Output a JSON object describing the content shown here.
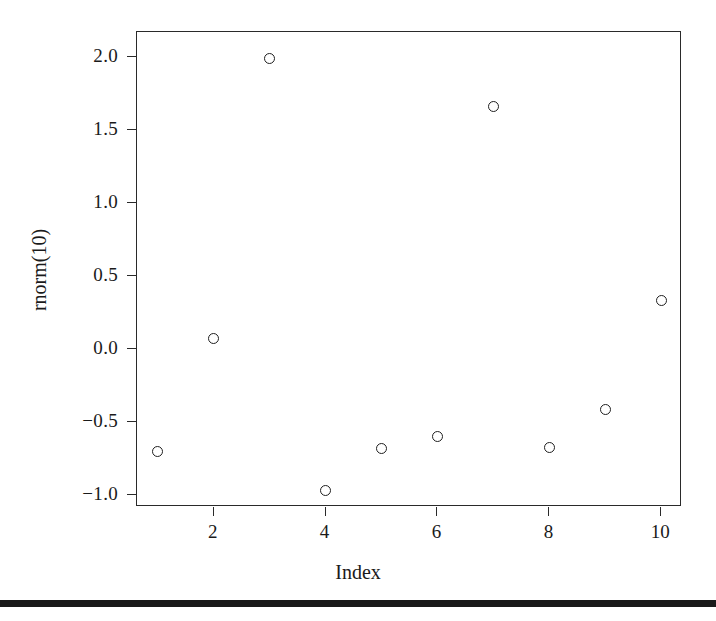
{
  "chart_data": {
    "type": "scatter",
    "title": "",
    "subtitle": "",
    "xlabel": "Index",
    "ylabel": "rnorm(10)",
    "x": [
      1,
      2,
      3,
      4,
      5,
      6,
      7,
      8,
      9,
      10
    ],
    "values": [
      -0.7,
      0.07,
      1.99,
      -0.97,
      -0.68,
      -0.6,
      1.66,
      -0.67,
      -0.41,
      0.33
    ],
    "series": [
      {
        "name": "rnorm(10)",
        "values": [
          -0.7,
          0.07,
          1.99,
          -0.97,
          -0.68,
          -0.6,
          1.66,
          -0.67,
          -0.41,
          0.33
        ]
      }
    ],
    "points": [
      {
        "x": 1,
        "y": -0.7
      },
      {
        "x": 2,
        "y": 0.07
      },
      {
        "x": 3,
        "y": 1.99
      },
      {
        "x": 4,
        "y": -0.97
      },
      {
        "x": 5,
        "y": -0.68
      },
      {
        "x": 6,
        "y": -0.6
      },
      {
        "x": 7,
        "y": 1.66
      },
      {
        "x": 8,
        "y": -0.67
      },
      {
        "x": 9,
        "y": -0.41
      },
      {
        "x": 10,
        "y": 0.33
      }
    ],
    "xlim": [
      0.63,
      10.37
    ],
    "ylim": [
      -1.08,
      2.17
    ],
    "xticks": [
      2,
      4,
      6,
      8,
      10
    ],
    "xtick_labels": [
      "2",
      "4",
      "6",
      "8",
      "10"
    ],
    "yticks": [
      2.0,
      1.5,
      1.0,
      0.5,
      0.0,
      -0.5,
      -1.0
    ],
    "ytick_labels": [
      "2.0",
      "1.5",
      "1.0",
      "0.5",
      "0.0",
      "−0.5",
      "−1.0"
    ],
    "grid": false,
    "legend": null,
    "marker": "open-circle",
    "marker_color": "#1f1f1f",
    "background_color": "#ffffff",
    "axis_color": "#2a2a2a",
    "annotations": []
  },
  "figure": {
    "bottom_rule_color": "#1a1a1a"
  }
}
